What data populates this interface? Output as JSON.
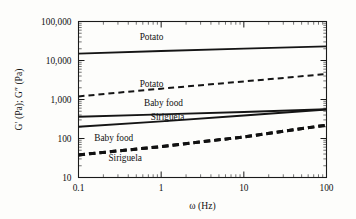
{
  "chart_data": {
    "type": "line",
    "title": "",
    "xlabel": "ω (Hz)",
    "ylabel": "G′ (Pa); G″ (Pa)",
    "xscale": "log",
    "yscale": "log",
    "xlim": [
      0.1,
      100
    ],
    "ylim": [
      10,
      100000
    ],
    "xticks": [
      "0.1",
      "1",
      "10",
      "100"
    ],
    "xtick_values": [
      0.1,
      1,
      10,
      100
    ],
    "yticks": [
      "10",
      "100",
      "1,000",
      "10,000",
      "100,000"
    ],
    "ytick_values": [
      10,
      100,
      1000,
      10000,
      100000
    ],
    "grid": false,
    "legend": "inline-annotations",
    "series": [
      {
        "name": "Potato",
        "modulus": "G′",
        "style": "solid",
        "label": "Potato",
        "x": [
          0.1,
          1,
          10,
          100
        ],
        "values": [
          15000,
          17500,
          20200,
          23000
        ]
      },
      {
        "name": "Potato",
        "modulus": "G″",
        "style": "dashed",
        "label": "Potato",
        "x": [
          0.1,
          1,
          10,
          100
        ],
        "values": [
          1200,
          1900,
          2900,
          4500
        ]
      },
      {
        "name": "Baby food",
        "modulus": "G′",
        "style": "solid",
        "label": "Baby food",
        "x": [
          0.1,
          1,
          10,
          100
        ],
        "values": [
          360,
          415,
          480,
          560
        ]
      },
      {
        "name": "Siriguela",
        "modulus": "G′",
        "style": "solid",
        "label": "Siriguela",
        "x": [
          0.1,
          1,
          10,
          100
        ],
        "values": [
          200,
          275,
          390,
          555
        ]
      },
      {
        "name": "Baby food",
        "modulus": "G″",
        "style": "dashed-thick",
        "label": "Baby food",
        "x": [
          0.1,
          1,
          10,
          100
        ],
        "values": [
          38,
          62,
          110,
          220
        ]
      },
      {
        "name": "Siriguela",
        "modulus": "G″",
        "style": "dashed-thick",
        "label": "Siriguela",
        "x": [
          0.1,
          1,
          10,
          100
        ],
        "values": [
          38,
          62,
          110,
          220
        ]
      }
    ],
    "annotations": [
      {
        "text": "Potato",
        "x": 0.55,
        "y": 33000,
        "name": "potato-storage"
      },
      {
        "text": "Potato",
        "x": 0.55,
        "y": 2100,
        "name": "potato-loss"
      },
      {
        "text": "Baby food",
        "x": 0.62,
        "y": 700,
        "name": "babyfood-storage"
      },
      {
        "text": "Siriguela",
        "x": 0.75,
        "y": 290,
        "name": "siriguela-storage"
      },
      {
        "text": "Baby food",
        "x": 0.155,
        "y": 88,
        "name": "babyfood-loss"
      },
      {
        "text": "Siriguela",
        "x": 0.23,
        "y": 26,
        "name": "siriguela-loss"
      }
    ]
  },
  "colors": {
    "background": "#fdfdfb",
    "axis": "#1a1a1a",
    "series": "#151515"
  }
}
